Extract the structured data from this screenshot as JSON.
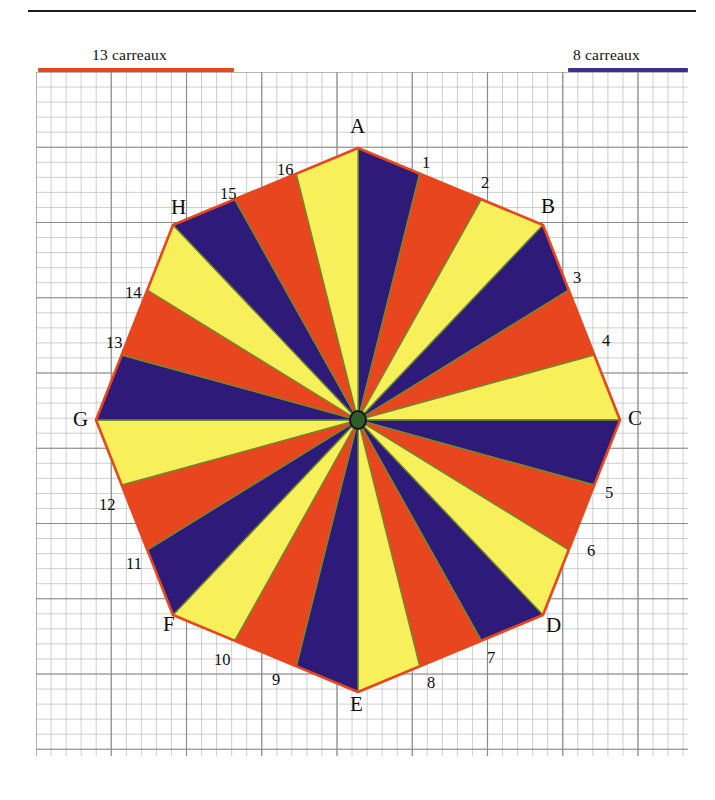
{
  "legend": {
    "left": {
      "text": "13 carreaux",
      "color": "#e8461e",
      "cells": 13
    },
    "right": {
      "text": "8 carreaux",
      "color": "#3b2f8f",
      "cells": 8
    }
  },
  "figure": {
    "shape": "regular-octagon",
    "sector_count": 24,
    "center_marker_color": "#2f5d2a",
    "palette": {
      "purple": "#2e1a78",
      "orange": "#e8461e",
      "yellow": "#f7f05a",
      "outline": "#6d8a2e",
      "edge": "#e8461e",
      "grid_minor": "#b9b9b9",
      "grid_major": "#8a8a8a"
    },
    "sector_colors": [
      "purple",
      "orange",
      "yellow",
      "purple",
      "orange",
      "yellow",
      "purple",
      "orange",
      "yellow",
      "purple",
      "orange",
      "yellow",
      "purple",
      "orange",
      "yellow",
      "purple",
      "orange",
      "yellow",
      "purple",
      "orange",
      "yellow",
      "purple",
      "orange",
      "yellow"
    ],
    "vertices": [
      {
        "name": "A",
        "x": 358,
        "y": 148,
        "lx": 350,
        "ly": 116
      },
      {
        "name": "B",
        "x": 543,
        "y": 225,
        "lx": 541,
        "ly": 196
      },
      {
        "name": "C",
        "x": 620,
        "y": 420,
        "lx": 628,
        "ly": 408
      },
      {
        "name": "D",
        "x": 543,
        "y": 615,
        "lx": 546,
        "ly": 615
      },
      {
        "name": "E",
        "x": 358,
        "y": 692,
        "lx": 350,
        "ly": 694
      },
      {
        "name": "F",
        "x": 173,
        "y": 615,
        "lx": 163,
        "ly": 614
      },
      {
        "name": "G",
        "x": 96,
        "y": 420,
        "lx": 73,
        "ly": 409
      },
      {
        "name": "H",
        "x": 173,
        "y": 225,
        "lx": 171,
        "ly": 197
      }
    ],
    "edge_numbers": [
      {
        "n": "1",
        "x": 422,
        "ly": 155
      },
      {
        "n": "2",
        "x": 481,
        "ly": 175
      },
      {
        "n": "3",
        "x": 573,
        "ly": 270
      },
      {
        "n": "4",
        "x": 602,
        "ly": 333
      },
      {
        "n": "5",
        "x": 605,
        "ly": 485
      },
      {
        "n": "6",
        "x": 587,
        "ly": 543
      },
      {
        "n": "7",
        "x": 487,
        "ly": 650
      },
      {
        "n": "8",
        "x": 427,
        "ly": 675
      },
      {
        "n": "9",
        "x": 272,
        "ly": 672
      },
      {
        "n": "10",
        "x": 214,
        "ly": 652
      },
      {
        "n": "11",
        "x": 126,
        "ly": 556
      },
      {
        "n": "12",
        "x": 99,
        "ly": 497
      },
      {
        "n": "13",
        "x": 106,
        "ly": 335
      },
      {
        "n": "14",
        "x": 125,
        "ly": 285
      },
      {
        "n": "15",
        "x": 220,
        "ly": 186
      },
      {
        "n": "16",
        "x": 277,
        "ly": 162
      }
    ]
  }
}
